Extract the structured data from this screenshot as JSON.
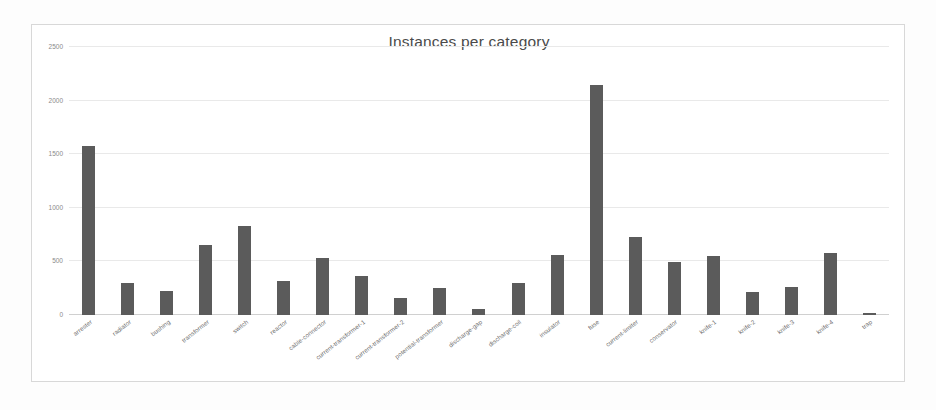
{
  "chart_data": {
    "type": "bar",
    "title": "Instances per category",
    "xlabel": "",
    "ylabel": "",
    "ylim": [
      0,
      2500
    ],
    "grid": true,
    "legend": "none",
    "yticks": [
      2500,
      2000,
      1500,
      1000,
      500,
      0
    ],
    "bar_color": "#5b5b5b",
    "categories": [
      "arrester",
      "radiator",
      "bushing",
      "transformer",
      "switch",
      "reactor",
      "cable-connector",
      "current-transformer-1",
      "current-transformer-2",
      "potential-transformer",
      "discharge-gap",
      "discharge-coil",
      "insulator",
      "fuse",
      "current-limiter",
      "conservator",
      "knife-1",
      "knife-2",
      "knife-3",
      "knife-4",
      "trap"
    ],
    "values": [
      1580,
      300,
      225,
      650,
      830,
      315,
      530,
      365,
      160,
      255,
      60,
      300,
      560,
      2150,
      725,
      495,
      555,
      215,
      265,
      580,
      15
    ]
  }
}
